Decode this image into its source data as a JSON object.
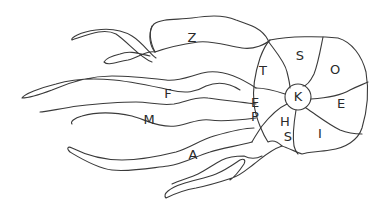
{
  "diagram": {
    "stroke_color": "#3a3a3a",
    "background": "#ffffff",
    "head": {
      "center_label": "K",
      "segments": [
        {
          "id": "s",
          "label": "S"
        },
        {
          "id": "o",
          "label": "O"
        },
        {
          "id": "e",
          "label": "E"
        },
        {
          "id": "i",
          "label": "I"
        },
        {
          "id": "hs",
          "label_line1": "H",
          "label_line2": "S"
        },
        {
          "id": "ep",
          "label_line1": "E",
          "label_line2": "P"
        },
        {
          "id": "t",
          "label": "T"
        }
      ]
    },
    "tentacles": [
      {
        "id": "z",
        "label": "Z"
      },
      {
        "id": "f",
        "label": "F"
      },
      {
        "id": "m",
        "label": "M"
      },
      {
        "id": "a",
        "label": "A"
      }
    ]
  }
}
